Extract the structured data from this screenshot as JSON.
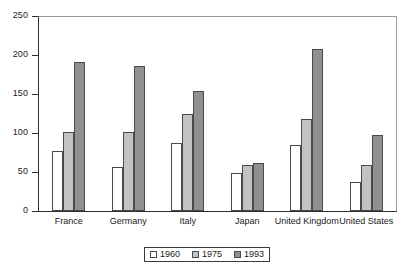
{
  "chart_data": {
    "type": "bar",
    "title": "",
    "xlabel": "",
    "ylabel": "",
    "ylim": [
      0,
      250
    ],
    "yticks": [
      0,
      50,
      100,
      150,
      200,
      250
    ],
    "grid": false,
    "legend_position": "bottom-center",
    "categories": [
      "France",
      "Germany",
      "Italy",
      "Japan",
      "United Kingdom",
      "United States"
    ],
    "series": [
      {
        "name": "1960",
        "color": "#ffffff",
        "values": [
          77,
          56,
          87,
          49,
          85,
          37
        ]
      },
      {
        "name": "1975",
        "color": "#c2c2c2",
        "values": [
          101,
          101,
          124,
          59,
          118,
          59
        ]
      },
      {
        "name": "1993",
        "color": "#909090",
        "values": [
          191,
          186,
          154,
          61,
          208,
          98
        ]
      }
    ]
  },
  "axis": {
    "y_tick_labels": [
      "250",
      "200",
      "150",
      "100",
      "50",
      "0"
    ]
  },
  "legend": {
    "entries": [
      {
        "label": "1960"
      },
      {
        "label": "1975"
      },
      {
        "label": "1993"
      }
    ]
  }
}
